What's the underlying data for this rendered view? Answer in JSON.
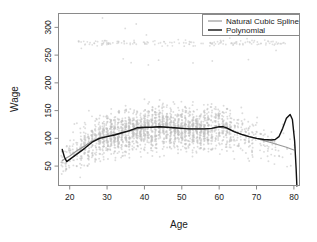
{
  "chart_data": {
    "type": "scatter",
    "title": "",
    "xlabel": "Age",
    "ylabel": "Wage",
    "xlim": [
      17,
      81.5
    ],
    "ylim": [
      15,
      325
    ],
    "xticks": [
      20,
      30,
      40,
      50,
      60,
      70,
      80
    ],
    "yticks": [
      50,
      100,
      150,
      200,
      250,
      300
    ],
    "xtick_labels": [
      "20",
      "30",
      "40",
      "50",
      "60",
      "70",
      "80"
    ],
    "ytick_labels": [
      "50",
      "100",
      "150",
      "200",
      "250",
      "300"
    ],
    "grid": false,
    "legend_position": "top-right",
    "legend": [
      {
        "label": "Natural Cubic Spline",
        "color": "#9a9a9a"
      },
      {
        "label": "Polynomial",
        "color": "#111111"
      }
    ],
    "point_color": "#bfbfbf",
    "point_description": "Individual wage observations, discrete integer ages forming vertical stripes; a dense high-wage band near 270-280.",
    "series": [
      {
        "name": "Natural Cubic Spline",
        "type": "line",
        "color": "#9a9a9a",
        "x": [
          18,
          20,
          22,
          24,
          26,
          28,
          30,
          32,
          34,
          36,
          38,
          40,
          42,
          44,
          46,
          48,
          50,
          52,
          54,
          56,
          58,
          60,
          62,
          64,
          66,
          68,
          70,
          72,
          74,
          76,
          78,
          80
        ],
        "y": [
          60,
          68,
          78,
          86,
          95,
          101,
          104,
          107,
          110,
          113,
          117,
          119,
          120,
          121,
          120,
          119,
          118,
          117,
          117,
          117,
          118,
          120,
          118,
          112,
          107,
          103,
          100,
          96,
          92,
          88,
          84,
          79
        ]
      },
      {
        "name": "Polynomial",
        "type": "line",
        "color": "#111111",
        "x": [
          18,
          18.6,
          19.2,
          20,
          22,
          24,
          26,
          28,
          30,
          32,
          34,
          36,
          38,
          40,
          42,
          44,
          46,
          48,
          50,
          52,
          54,
          56,
          58,
          60,
          61,
          62,
          64,
          66,
          68,
          70,
          72,
          74,
          75,
          76,
          77,
          78,
          79,
          79.6,
          80.2,
          80.6,
          80.8
        ],
        "y": [
          80,
          66,
          58,
          62,
          72,
          82,
          93,
          100,
          103,
          106,
          110,
          114,
          119,
          120,
          120,
          121,
          120,
          119,
          118,
          117,
          117,
          117,
          118,
          121,
          121,
          119,
          112,
          107,
          103,
          100,
          98,
          97,
          98,
          103,
          118,
          136,
          143,
          134,
          95,
          45,
          14
        ]
      }
    ]
  },
  "axes": {
    "x_axis_label": "Age",
    "y_axis_label": "Wage"
  }
}
